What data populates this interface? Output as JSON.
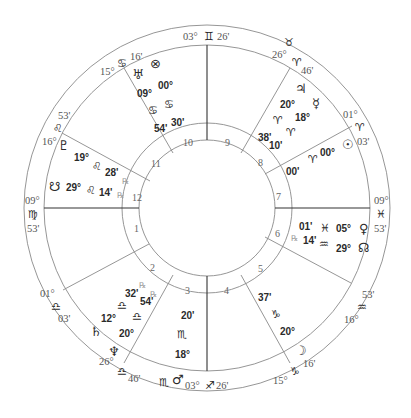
{
  "chart": {
    "type": "natal-wheel",
    "center": [
      207,
      208
    ],
    "radii": {
      "outer": 183,
      "sign_ring": 163,
      "house_ring_outer": 85,
      "house_ring_inner": 68
    }
  },
  "cusps": [
    {
      "house": 1,
      "deg": "09°",
      "sign_glyph": "♍",
      "sign": "Virgo",
      "min": "53'"
    },
    {
      "house": 2,
      "deg": "01°",
      "sign_glyph": "♎",
      "sign": "Libra",
      "min": "03'"
    },
    {
      "house": 3,
      "deg": "26°",
      "sign_glyph": "♎",
      "sign": "Libra",
      "min": "46'"
    },
    {
      "house": 4,
      "deg": "03°",
      "sign_glyph": "♐",
      "sign": "Sagittarius",
      "min": "26'"
    },
    {
      "house": 5,
      "deg": "15°",
      "sign_glyph": "♑",
      "sign": "Capricorn",
      "min": "16'"
    },
    {
      "house": 6,
      "deg": "16°",
      "sign_glyph": "♒",
      "sign": "Aquarius",
      "min": "53'"
    },
    {
      "house": 7,
      "deg": "09°",
      "sign_glyph": "♓",
      "sign": "Pisces",
      "min": "53'"
    },
    {
      "house": 8,
      "deg": "01°",
      "sign_glyph": "♈",
      "sign": "Aries",
      "min": "03'"
    },
    {
      "house": 9,
      "deg": "26°",
      "sign_glyph": "♈",
      "sign": "Aries",
      "min": "46'"
    },
    {
      "house": 10,
      "deg": "03°",
      "sign_glyph": "♊",
      "sign": "Gemini",
      "min": "26'"
    },
    {
      "house": 11,
      "deg": "15°",
      "sign_glyph": "♋",
      "sign": "Cancer",
      "min": "16'"
    },
    {
      "house": 12,
      "deg": "16°",
      "sign_glyph": "♌",
      "sign": "Leo",
      "min": "53'"
    }
  ],
  "intercepted": [
    {
      "sign_glyph": "♉",
      "sign": "Taurus"
    },
    {
      "sign_glyph": "♏",
      "sign": "Scorpio"
    }
  ],
  "house_numbers": [
    "1",
    "2",
    "3",
    "4",
    "5",
    "6",
    "7",
    "8",
    "9",
    "10",
    "11",
    "12"
  ],
  "planets": [
    {
      "name": "Sun",
      "glyph": "☉",
      "deg": "00°",
      "sign_glyph": "♈",
      "min": "00'",
      "retro": ""
    },
    {
      "name": "Moon",
      "glyph": "☽",
      "deg": "20°",
      "sign_glyph": "♑",
      "min": "37'",
      "retro": ""
    },
    {
      "name": "Mercury",
      "glyph": "☿",
      "deg": "18°",
      "sign_glyph": "♈",
      "min": "10'",
      "retro": ""
    },
    {
      "name": "Venus",
      "glyph": "♀",
      "deg": "05°",
      "sign_glyph": "♓",
      "min": "01'",
      "retro": ""
    },
    {
      "name": "Mars",
      "glyph": "♂",
      "deg": "18°",
      "sign_glyph": "♏",
      "min": "20'",
      "retro": ""
    },
    {
      "name": "Jupiter",
      "glyph": "♃",
      "deg": "20°",
      "sign_glyph": "♈",
      "min": "38'",
      "retro": ""
    },
    {
      "name": "Saturn",
      "glyph": "♄",
      "deg": "12°",
      "sign_glyph": "♎",
      "min": "32'",
      "retro": "℞"
    },
    {
      "name": "Uranus",
      "glyph": "♅",
      "deg": "09°",
      "sign_glyph": "♋",
      "min": "54'",
      "retro": ""
    },
    {
      "name": "Neptune",
      "glyph": "♆",
      "deg": "20°",
      "sign_glyph": "♎",
      "min": "54'",
      "retro": "℞"
    },
    {
      "name": "Pluto",
      "glyph": "♇",
      "deg": "19°",
      "sign_glyph": "♌",
      "min": "28'",
      "retro": "℞"
    },
    {
      "name": "North Node",
      "glyph": "☊",
      "deg": "29°",
      "sign_glyph": "♒",
      "min": "14'",
      "retro": "℞"
    },
    {
      "name": "South Node",
      "glyph": "☋",
      "deg": "29°",
      "sign_glyph": "♌",
      "min": "14'",
      "retro": "℞"
    },
    {
      "name": "Part of Fortune",
      "glyph": "⊗",
      "deg": "00°",
      "sign_glyph": "♋",
      "min": "30'",
      "retro": ""
    }
  ]
}
